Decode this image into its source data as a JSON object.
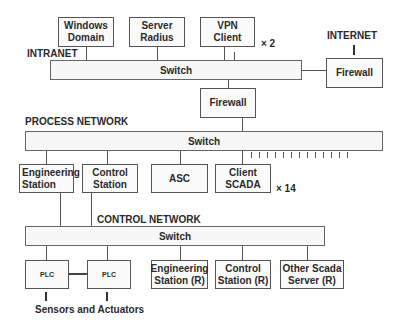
{
  "intranet": {
    "label": "INTRANET",
    "switch_label": "Switch",
    "nodes": [
      {
        "id": "windows-domain",
        "line1": "Windows",
        "line2": "Domain"
      },
      {
        "id": "server-radius",
        "line1": "Server",
        "line2": "Radius"
      },
      {
        "id": "vpn-client",
        "line1": "VPN",
        "line2": "Client",
        "multiplier": "× 2"
      }
    ]
  },
  "internet": {
    "label": "INTERNET",
    "firewall_label": "Firewall"
  },
  "middle_firewall": {
    "label": "Firewall"
  },
  "process_network": {
    "label": "PROCESS NETWORK",
    "switch_label": "Switch",
    "nodes": [
      {
        "id": "engineering-station",
        "line1": "Engineering",
        "line2": "Station"
      },
      {
        "id": "control-station",
        "line1": "Control",
        "line2": "Station"
      },
      {
        "id": "asc",
        "line1": "ASC",
        "line2": ""
      },
      {
        "id": "client-scada",
        "line1": "Client",
        "line2": "SCADA",
        "multiplier": "× 14"
      }
    ]
  },
  "control_network": {
    "label": "CONTROL NETWORK",
    "switch_label": "Switch",
    "nodes": [
      {
        "id": "plc-1",
        "line1": "PLC"
      },
      {
        "id": "plc-2",
        "line1": "PLC"
      },
      {
        "id": "engineering-station-r",
        "line1": "Engineering",
        "line2": "Station (R)"
      },
      {
        "id": "control-station-r",
        "line1": "Control",
        "line2": "Station (R)"
      },
      {
        "id": "other-scada-server-r",
        "line1": "Other Scada",
        "line2": "Server (R)"
      }
    ]
  },
  "sensors": {
    "label": "Sensors and Actuators"
  }
}
